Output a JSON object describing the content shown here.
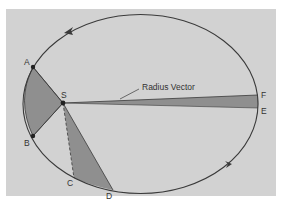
{
  "diagram": {
    "colors": {
      "background": "#d2d2d2",
      "shaded_area": "#8f8f8f",
      "orbit_line": "#3a3a3a",
      "label_text": "#333333"
    },
    "labels": {
      "sun": "S",
      "point_a": "A",
      "point_b": "B",
      "point_c": "C",
      "point_d": "D",
      "point_e": "E",
      "point_f": "F",
      "radius_vector": "Radius Vector"
    },
    "elements": [
      {
        "name": "orbit-ellipse",
        "shape": "ellipse",
        "direction": "counter-clockwise"
      },
      {
        "name": "sector-a-b",
        "from": "A",
        "to": "B",
        "focus": "S"
      },
      {
        "name": "sector-c-d",
        "from": "C",
        "to": "D",
        "focus": "S"
      },
      {
        "name": "sector-e-f",
        "from": "E",
        "to": "F",
        "focus": "S"
      }
    ]
  }
}
